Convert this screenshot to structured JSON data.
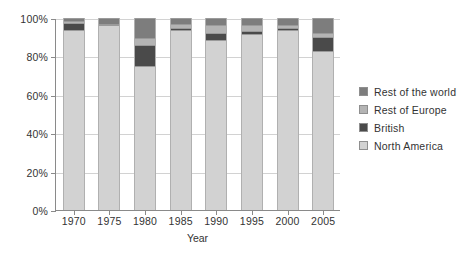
{
  "chart_data": {
    "type": "bar",
    "subtype": "stacked-100-percent",
    "title": "",
    "xlabel": "Year",
    "ylabel": "",
    "categories": [
      "1970",
      "1975",
      "1980",
      "1985",
      "1990",
      "1995",
      "2000",
      "2005"
    ],
    "ylim": [
      0,
      100
    ],
    "ytick_labels": [
      "0%",
      "20%",
      "40%",
      "60%",
      "80%",
      "100%"
    ],
    "ytick_values": [
      0,
      20,
      40,
      60,
      80,
      100
    ],
    "grid": true,
    "grid_axis": "y",
    "legend_position": "right",
    "series": [
      {
        "name": "North America",
        "color": "#d2d2d2",
        "values": [
          94,
          96.5,
          75,
          93.5,
          88.5,
          91.5,
          94,
          83
        ]
      },
      {
        "name": "British",
        "color": "#4a4a4a",
        "values": [
          3.5,
          0,
          11,
          1.5,
          3.5,
          1.5,
          1,
          7
        ]
      },
      {
        "name": "Rest of Europe",
        "color": "#b4b4b4",
        "values": [
          1,
          0.5,
          3.5,
          2,
          4.5,
          3.5,
          1.5,
          2
        ]
      },
      {
        "name": "Rest of the world",
        "color": "#7d7d7d",
        "values": [
          1.5,
          3,
          10.5,
          3,
          3.5,
          3.5,
          3.5,
          8
        ]
      }
    ]
  },
  "legend": {
    "items": [
      {
        "label": "Rest of the world",
        "color": "#7d7d7d"
      },
      {
        "label": "Rest of Europe",
        "color": "#b4b4b4"
      },
      {
        "label": "British",
        "color": "#4a4a4a"
      },
      {
        "label": "North America",
        "color": "#d2d2d2"
      }
    ]
  },
  "colors": {
    "axis": "#8a8a8a",
    "grid": "#d2d2d2",
    "text": "#333333",
    "background": "#ffffff"
  }
}
